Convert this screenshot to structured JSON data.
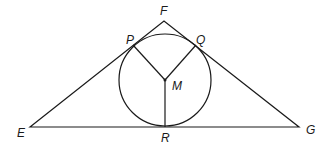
{
  "diagram": {
    "title": "",
    "type": "triangle-with-incircle",
    "points": {
      "E": {
        "label": "E",
        "x": 30,
        "y": 127
      },
      "F": {
        "label": "F",
        "x": 164,
        "y": 21
      },
      "G": {
        "label": "G",
        "x": 299,
        "y": 127
      },
      "P": {
        "label": "P",
        "x": 133,
        "y": 45
      },
      "Q": {
        "label": "Q",
        "x": 196,
        "y": 45
      },
      "R": {
        "label": "R",
        "x": 165,
        "y": 127
      },
      "M": {
        "label": "M",
        "x": 165,
        "y": 80
      }
    },
    "circle": {
      "center": "M",
      "radius": 46
    },
    "segments": [
      [
        "E",
        "F"
      ],
      [
        "F",
        "G"
      ],
      [
        "E",
        "G"
      ],
      [
        "M",
        "P"
      ],
      [
        "M",
        "Q"
      ],
      [
        "M",
        "R"
      ]
    ],
    "labels": {
      "E": "E",
      "F": "F",
      "G": "G",
      "P": "P",
      "Q": "Q",
      "R": "R",
      "M": "M"
    }
  }
}
